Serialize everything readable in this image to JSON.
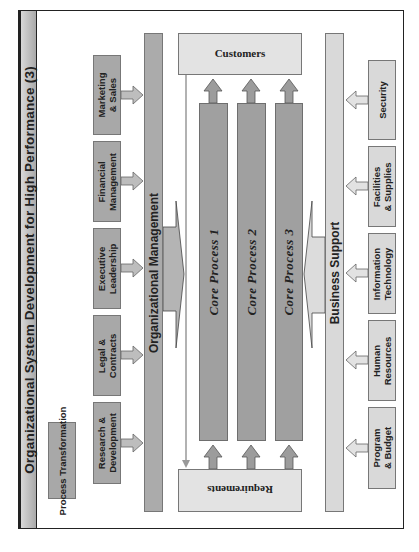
{
  "title": "Organizational System Development for High Performance (3)",
  "process_transformation": "Process Transformation",
  "left_units": [
    {
      "line1": "Marketing",
      "line2": "& Sales"
    },
    {
      "line1": "Financial",
      "line2": "Management"
    },
    {
      "line1": "Executive",
      "line2": "Leadership"
    },
    {
      "line1": "Legal &",
      "line2": "Contracts"
    },
    {
      "line1": "Research &",
      "line2": "Development"
    }
  ],
  "left_bar": "Organizational Management",
  "customers": "Customers",
  "requirements": "Requirements",
  "core_processes": [
    "Core Process 1",
    "Core Process 2",
    "Core Process 3"
  ],
  "right_bar": "Business Support",
  "right_units": [
    {
      "line1": "Security",
      "line2": ""
    },
    {
      "line1": "Facilities",
      "line2": "& Supplies"
    },
    {
      "line1": "Information",
      "line2": "Technology"
    },
    {
      "line1": "Human",
      "line2": "Resources"
    },
    {
      "line1": "Program",
      "line2": "& Budget"
    }
  ],
  "colors": {
    "dark_box": "#a8a8a8",
    "light_box": "#d9d9d9",
    "process_bar": "#a0a0a0",
    "border": "#222222"
  }
}
